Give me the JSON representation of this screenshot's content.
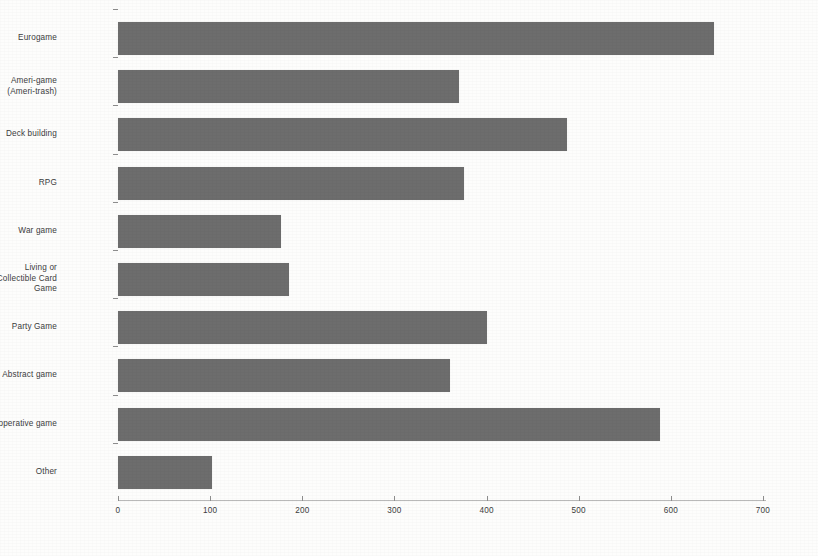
{
  "chart_data": {
    "type": "bar",
    "orientation": "horizontal",
    "title": "",
    "subtitle": "",
    "xlabel": "",
    "ylabel": "",
    "xlim": [
      0,
      700
    ],
    "ylim": null,
    "grid": false,
    "legend": null,
    "legend_position": "none",
    "bar_color": "#6d6d6d",
    "axis_color": "#8d8d8d",
    "xticks": [
      0,
      100,
      200,
      300,
      400,
      500,
      600,
      700
    ],
    "xtick_labels": [
      "0",
      "100",
      "200",
      "300",
      "400",
      "500",
      "600",
      "700"
    ],
    "categories": [
      "Eurogame",
      "Ameri-game\n(Ameri-trash)",
      "Deck building",
      "RPG",
      "War game",
      "Living or\nCollectible Card\nGame",
      "Party Game",
      "Abstract game",
      "Cooperative game",
      "Other"
    ],
    "values": [
      647,
      370,
      487,
      375,
      177,
      186,
      400,
      360,
      588,
      102
    ]
  }
}
